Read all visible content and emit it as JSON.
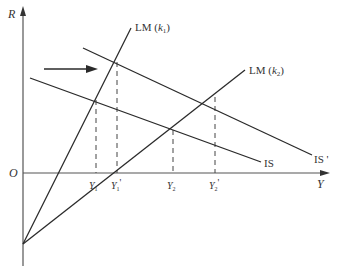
{
  "diagram": {
    "type": "IS-LM",
    "axes": {
      "y_label": "R",
      "x_label": "Y",
      "origin_label": "O"
    },
    "curves": [
      {
        "id": "lm_k1",
        "label_prefix": "LM (",
        "label_var": "k",
        "label_sub": "1",
        "label_suffix": ")"
      },
      {
        "id": "lm_k2",
        "label_prefix": "LM (",
        "label_var": "k",
        "label_sub": "2",
        "label_suffix": ")"
      },
      {
        "id": "is",
        "label": "IS"
      },
      {
        "id": "is_prime",
        "label": "IS '"
      }
    ],
    "x_ticks": [
      {
        "var": "Y",
        "sub": "1",
        "prime": ""
      },
      {
        "var": "Y",
        "sub": "1",
        "prime": "'"
      },
      {
        "var": "Y",
        "sub": "2",
        "prime": ""
      },
      {
        "var": "Y",
        "sub": "2",
        "prime": "'"
      }
    ],
    "annotation": "rightward shift arrow (IS → IS')",
    "colors": {
      "line": "#2a2a2a",
      "axis": "#555555",
      "text": "#333333"
    }
  }
}
